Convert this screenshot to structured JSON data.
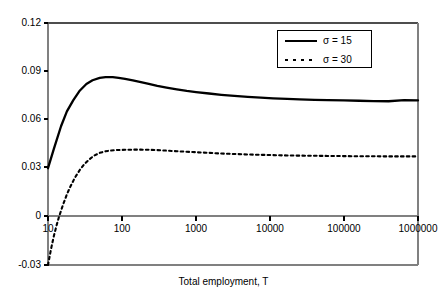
{
  "chart_data": {
    "type": "line",
    "title": "",
    "xlabel": "Total employment, T",
    "ylabel": "",
    "xscale": "log",
    "xlim": [
      10,
      1000000
    ],
    "ylim": [
      -0.03,
      0.12
    ],
    "grid": false,
    "legend_position": "top-right",
    "x_ticks": [
      "10",
      "100",
      "1000",
      "10000",
      "100000",
      "1000000"
    ],
    "x_tick_values": [
      10,
      100,
      1000,
      10000,
      100000,
      1000000
    ],
    "y_ticks": [
      "0.12",
      "0.09",
      "0.06",
      "0.03",
      "0",
      "-0.03"
    ],
    "y_tick_values": [
      0.12,
      0.09,
      0.06,
      0.03,
      0,
      -0.03
    ],
    "series": [
      {
        "name": "σ = 15",
        "style": "solid",
        "color": "#000000",
        "x": [
          10,
          12,
          15,
          18,
          22,
          27,
          33,
          40,
          50,
          60,
          75,
          90,
          110,
          140,
          180,
          230,
          300,
          400,
          550,
          750,
          1000,
          1500,
          2200,
          3300,
          5000,
          7500,
          11000,
          17000,
          25000,
          40000,
          60000,
          100000,
          160000,
          250000,
          400000,
          650000,
          1000000
        ],
        "y": [
          0.03,
          0.042,
          0.056,
          0.0652,
          0.0722,
          0.0782,
          0.0822,
          0.0845,
          0.086,
          0.0865,
          0.0864,
          0.086,
          0.0854,
          0.0845,
          0.0834,
          0.0823,
          0.0811,
          0.08,
          0.0789,
          0.0779,
          0.0772,
          0.0763,
          0.0755,
          0.0748,
          0.0742,
          0.0737,
          0.0733,
          0.073,
          0.0727,
          0.0724,
          0.0722,
          0.072,
          0.0718,
          0.0716,
          0.0715,
          0.0722,
          0.072
        ]
      },
      {
        "name": "σ = 30",
        "style": "dotted",
        "color": "#000000",
        "x": [
          10,
          11,
          12,
          13,
          14,
          16,
          18,
          20,
          23,
          27,
          31,
          36,
          42,
          50,
          60,
          72,
          88,
          110,
          140,
          180,
          230,
          300,
          400,
          550,
          750,
          1000,
          1500,
          2200,
          3300,
          5000,
          7500,
          11000,
          17000,
          25000,
          40000,
          60000,
          100000,
          160000,
          250000,
          400000,
          650000,
          1000000
        ],
        "y": [
          -0.03,
          -0.02,
          -0.012,
          -0.0058,
          -0.0005,
          0.0075,
          0.0138,
          0.0185,
          0.024,
          0.029,
          0.0325,
          0.0354,
          0.0378,
          0.0395,
          0.0405,
          0.041,
          0.0413,
          0.0414,
          0.0415,
          0.0415,
          0.0414,
          0.0412,
          0.0409,
          0.0405,
          0.0402,
          0.0399,
          0.0395,
          0.0391,
          0.0388,
          0.0385,
          0.0383,
          0.0381,
          0.0379,
          0.0378,
          0.0377,
          0.0376,
          0.0375,
          0.0374,
          0.0374,
          0.0373,
          0.0373,
          0.0373
        ]
      }
    ],
    "legend": [
      {
        "label": "σ = 15",
        "style": "solid"
      },
      {
        "label": "σ = 30",
        "style": "dotted"
      }
    ]
  }
}
